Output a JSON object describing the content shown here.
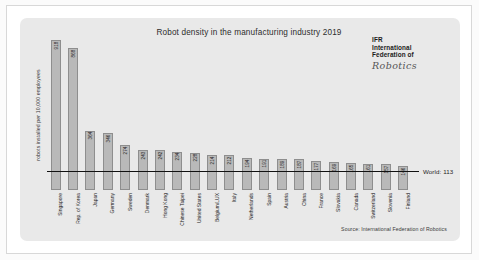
{
  "chart_data": {
    "type": "bar",
    "title": "Robot density in the manufacturing industry 2019",
    "xlabel": "",
    "ylabel": "robots installed per 10,000 employees",
    "ylim": [
      0,
      918
    ],
    "grid": false,
    "legend": "none",
    "categories": [
      "Singapore",
      "Rep. of Korea",
      "Japan",
      "Germany",
      "Sweden",
      "Denmark",
      "Hong Kong",
      "Chinese Taipei",
      "United States",
      "Belgium/LUX",
      "Italy",
      "Netherlands",
      "Spain",
      "Austria",
      "China",
      "France",
      "Slovakia",
      "Canada",
      "Switzerland",
      "Slovenia",
      "Finland"
    ],
    "values": [
      918,
      868,
      364,
      346,
      274,
      243,
      242,
      234,
      228,
      214,
      212,
      194,
      191,
      189,
      187,
      177,
      169,
      165,
      161,
      157,
      146
    ],
    "annotations": [
      {
        "text": "World: 113",
        "value": 113
      }
    ],
    "source": "Source: International Federation of Robotics"
  },
  "logo": {
    "line1": "IFR",
    "line2": "International",
    "line3": "Federation of",
    "line4": "Robotics"
  }
}
